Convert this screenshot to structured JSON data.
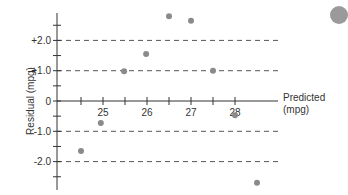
{
  "chart_data": {
    "type": "scatter",
    "title": "",
    "xlabel": "Predicted (mpg)",
    "xlabel_lines": [
      "Predicted",
      "(mpg)"
    ],
    "ylabel": "Residual (mpg)",
    "xlim": [
      23.9,
      29.0
    ],
    "ylim": [
      -2.95,
      2.9
    ],
    "x_ticks": [
      24.5,
      25,
      25.5,
      26,
      26.5,
      27,
      27.5,
      28
    ],
    "x_tick_labels": [
      "",
      "25",
      "",
      "26",
      "",
      "27",
      "",
      "28"
    ],
    "y_ticks": [
      2.5,
      2.0,
      1.5,
      1.0,
      0.5,
      0,
      -0.5,
      -1.0,
      -1.5,
      -2.0,
      -2.5
    ],
    "y_tick_labels": [
      "",
      "+2.0",
      "",
      "+1.0",
      "",
      "0",
      "",
      "-1.0",
      "",
      "-2.0",
      ""
    ],
    "reference_lines": [
      2.0,
      1.0,
      -1.0,
      -2.0
    ],
    "grid": false,
    "points": [
      {
        "x": 24.5,
        "y": -1.65
      },
      {
        "x": 24.95,
        "y": -0.73
      },
      {
        "x": 25.48,
        "y": 0.98
      },
      {
        "x": 25.98,
        "y": 1.55
      },
      {
        "x": 26.5,
        "y": 2.8
      },
      {
        "x": 27.0,
        "y": 2.65
      },
      {
        "x": 27.5,
        "y": 1.0
      },
      {
        "x": 28.0,
        "y": -0.47
      },
      {
        "x": 28.5,
        "y": -2.7
      }
    ],
    "marker_color": "#8a8a8a",
    "axis_color": "#333333",
    "dash_color": "#555555"
  }
}
